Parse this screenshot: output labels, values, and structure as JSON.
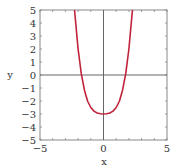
{
  "chart_data": {
    "type": "line",
    "title": "",
    "xlabel": "x",
    "ylabel": "y",
    "xlim": [
      -5,
      5
    ],
    "ylim": [
      -5,
      5
    ],
    "grid": false,
    "legend": null,
    "x_ticks": [
      "-5",
      "0",
      "5"
    ],
    "y_ticks": [
      "5",
      "4",
      "3",
      "2",
      "1",
      "0",
      "-1",
      "-2",
      "-3",
      "-4",
      "-5"
    ],
    "series": [
      {
        "name": "curve",
        "color": "#c0223b",
        "x": [
          -2.28,
          -2.0,
          -1.75,
          -1.5,
          -1.25,
          -1.0,
          -0.75,
          -0.5,
          -0.25,
          0,
          0.25,
          0.5,
          0.75,
          1.0,
          1.25,
          1.5,
          1.75,
          2.0,
          2.28
        ],
        "y": [
          5.0,
          2.0,
          0.1,
          -1.17,
          -2.02,
          -2.5,
          -2.78,
          -2.92,
          -2.98,
          -3.0,
          -2.98,
          -2.92,
          -2.78,
          -2.5,
          -2.02,
          -1.17,
          0.1,
          2.0,
          5.0
        ]
      }
    ],
    "axis_color": "#666666",
    "frame_color": "#888888"
  }
}
